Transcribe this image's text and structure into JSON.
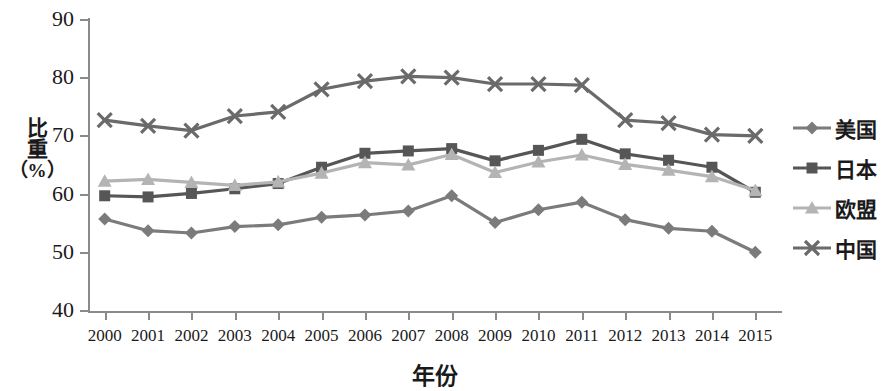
{
  "chart_data": {
    "type": "line",
    "title": "",
    "xlabel": "年份",
    "ylabel": "比重（%）",
    "ylabel_lines": [
      "比",
      "重",
      "（%）"
    ],
    "categories": [
      "2000",
      "2001",
      "2002",
      "2003",
      "2004",
      "2005",
      "2006",
      "2007",
      "2008",
      "2009",
      "2010",
      "2011",
      "2012",
      "2013",
      "2014",
      "2015"
    ],
    "ylim": [
      40,
      90
    ],
    "yticks": [
      40,
      50,
      60,
      70,
      80,
      90
    ],
    "grid": false,
    "legend_position": "right",
    "series": [
      {
        "name": "美国",
        "marker": "diamond",
        "color": "#7b7b7b",
        "values": [
          55.8,
          53.8,
          53.4,
          54.5,
          54.8,
          56.1,
          56.5,
          57.2,
          59.8,
          55.2,
          57.4,
          58.7,
          55.7,
          54.2,
          53.7,
          50.1
        ]
      },
      {
        "name": "日本",
        "marker": "square",
        "color": "#565656",
        "values": [
          59.8,
          59.6,
          60.2,
          61.0,
          61.9,
          64.7,
          67.1,
          67.5,
          67.9,
          65.8,
          67.6,
          69.5,
          67.0,
          65.9,
          64.7,
          60.4
        ]
      },
      {
        "name": "欧盟",
        "marker": "triangle",
        "color": "#b4b4b4",
        "values": [
          62.3,
          62.6,
          62.1,
          61.6,
          62.2,
          63.7,
          65.5,
          65.1,
          66.9,
          63.8,
          65.6,
          66.8,
          65.2,
          64.2,
          63.1,
          60.7
        ]
      },
      {
        "name": "中国",
        "marker": "cross",
        "color": "#6a6a6a",
        "values": [
          72.8,
          71.8,
          71.0,
          73.5,
          74.2,
          78.1,
          79.5,
          80.3,
          80.1,
          79.0,
          79.0,
          78.8,
          72.8,
          72.3,
          70.3,
          70.1
        ]
      }
    ]
  },
  "legend": {
    "items": [
      {
        "label": "美国"
      },
      {
        "label": "日本"
      },
      {
        "label": "欧盟"
      },
      {
        "label": "中国"
      }
    ]
  }
}
